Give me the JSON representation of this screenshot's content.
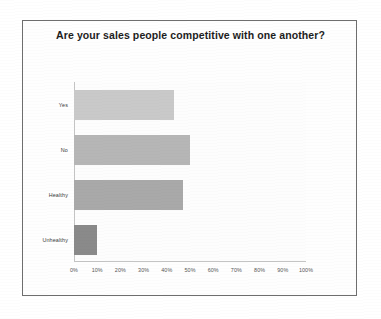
{
  "chart_data": {
    "type": "bar",
    "orientation": "horizontal",
    "title": "Are your sales people competitive with one another?",
    "categories": [
      "Yes",
      "No",
      "Healthy",
      "Unhealthy"
    ],
    "values": [
      43,
      50,
      47,
      10
    ],
    "bar_colors": [
      "#c9c9c9",
      "#b6b6b6",
      "#a9a9a9",
      "#8a8a8a"
    ],
    "xlabel": "",
    "ylabel": "",
    "xlim": [
      0,
      100
    ],
    "x_tick_labels": [
      "0%",
      "10%",
      "20%",
      "30%",
      "40%",
      "50%",
      "60%",
      "70%",
      "80%",
      "90%",
      "100%"
    ],
    "x_tick_values": [
      0,
      10,
      20,
      30,
      40,
      50,
      60,
      70,
      80,
      90,
      100
    ],
    "grid": false,
    "legend": false,
    "value_suffix": "%"
  },
  "frame": {
    "border_color": "#6e6e6e",
    "background": "#fefefe"
  }
}
